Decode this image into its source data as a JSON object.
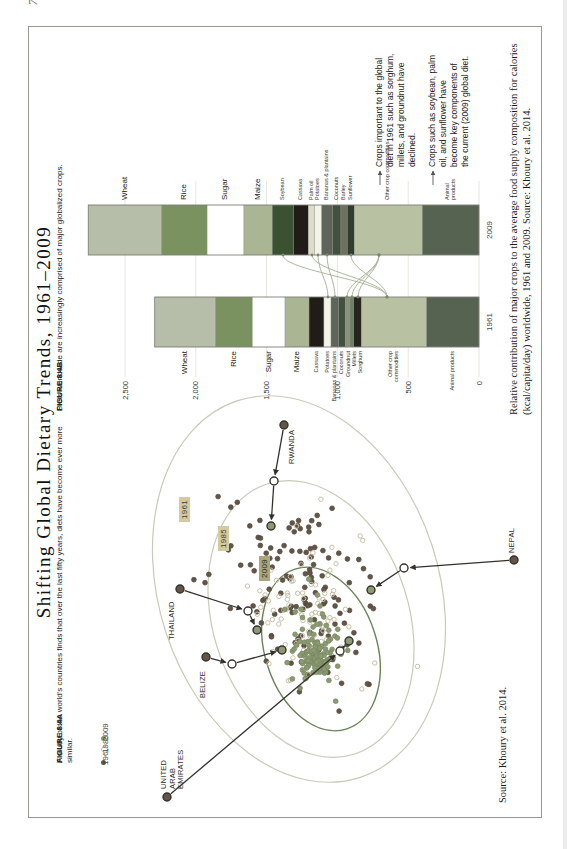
{
  "page": {
    "marker": "74"
  },
  "title": "Shifting Global Dietary Trends, 1961–2009",
  "figureA": {
    "caption_label": "FIGURE 8.4A",
    "caption_text": "A study of the world's countries finds that over the last fifty years, diets have become ever more similar.",
    "source": "Source: Khoury et al. 2014.",
    "legend": [
      {
        "label": "1961",
        "type": "filled",
        "color": "#635648"
      },
      {
        "label": "1985",
        "type": "open",
        "color": "#c7c1a8"
      },
      {
        "label": "2009",
        "type": "filled",
        "color": "#8b9a72"
      }
    ],
    "year_boxes": [
      {
        "label": "1961",
        "x": 295,
        "y": 150,
        "bg": "#d4caa0",
        "fg": "#3f3e35"
      },
      {
        "label": "1985",
        "x": 266,
        "y": 189,
        "bg": "#d4caa0",
        "fg": "#3f3e35"
      },
      {
        "label": "2009",
        "x": 236,
        "y": 230,
        "bg": "#a8a87c",
        "fg": "#262b1c"
      }
    ],
    "ellipses": [
      {
        "cx": 228,
        "cy": 270,
        "rx": 198,
        "ry": 140,
        "rot": -18,
        "stroke": "#c7cbb8",
        "width": 1.2
      },
      {
        "cx": 198,
        "cy": 282,
        "rx": 142,
        "ry": 98,
        "rot": -18,
        "stroke": "#c7cbb8",
        "width": 1.2
      },
      {
        "cx": 168,
        "cy": 292,
        "rx": 84,
        "ry": 56,
        "rot": -18,
        "stroke": "#6a8455",
        "width": 1.4
      }
    ],
    "clusters": [
      {
        "year": "1961",
        "type": "filled",
        "color": "#635648",
        "stroke": "#504538",
        "n": 128,
        "cx": 225,
        "cy": 268,
        "sx": 105,
        "sy": 72,
        "rot": -18,
        "seed": 101
      },
      {
        "year": "1985",
        "type": "open",
        "color": "#ffffff",
        "stroke": "#c7c1a8",
        "n": 92,
        "cx": 200,
        "cy": 280,
        "sx": 75,
        "sy": 52,
        "rot": -18,
        "seed": 202
      },
      {
        "year": "2009",
        "type": "filled",
        "color": "#8b9a72",
        "stroke": "#77865f",
        "n": 68,
        "cx": 175,
        "cy": 290,
        "sx": 42,
        "sy": 30,
        "rot": -18,
        "seed": 303
      },
      {
        "year": "2009",
        "type": "filled",
        "color": "#8b9a72",
        "stroke": "#77865f",
        "n": 72,
        "cx": 160,
        "cy": 288,
        "sx": 17,
        "sy": 12,
        "rot": -18,
        "seed": 404
      }
    ],
    "countries": [
      {
        "name": "UNITED ARAB EMIRATES",
        "label": "UNITED ARAB\nEMIRATES",
        "lx": 28,
        "ly": 131,
        "anchor": "start",
        "points": [
          [
            20,
            138
          ],
          [
            166,
            311
          ],
          [
            176,
            320
          ]
        ]
      },
      {
        "name": "BELIZE",
        "label": "BELIZE",
        "lx": 146,
        "ly": 170,
        "anchor": "end",
        "points": [
          [
            160,
            177
          ],
          [
            153,
            203
          ],
          [
            167,
            253
          ]
        ]
      },
      {
        "name": "THAILAND",
        "label": "THAILAND",
        "lx": 177,
        "ly": 139,
        "anchor": "start",
        "points": [
          [
            228,
            151
          ],
          [
            206,
            219
          ],
          [
            187,
            228
          ]
        ]
      },
      {
        "name": "RWANDA",
        "label": "RWANDA",
        "lx": 353,
        "ly": 259,
        "anchor": "start",
        "points": [
          [
            392,
            255
          ],
          [
            336,
            245
          ],
          [
            291,
            242
          ]
        ]
      },
      {
        "name": "NEPAL",
        "label": "NEPAL",
        "lx": 264,
        "ly": 479,
        "anchor": "start",
        "points": [
          [
            257,
            485
          ],
          [
            249,
            375
          ],
          [
            227,
            342
          ]
        ]
      }
    ]
  },
  "figureB": {
    "caption_label": "FIGURE 8.4B",
    "caption_text": "Diets worldwide are increasingly comprised of major globalized crops.",
    "description": "Relative contribution of major crops to the average food supply composition for calories (kcal/capita/day) worldwide, 1961 and 2009. Source: Khoury et al. 2014.",
    "annotations": [
      {
        "text": "Crops important to the global diet in 1961 such as sorghum, millets, and groundnut have declined."
      },
      {
        "text": "Crops such as soybean, palm oil, and sunflower have become key components of the current (2009) global diet."
      }
    ],
    "connectors": [
      {
        "from": "Sorghum (1961)",
        "to": "Other crop commodities (2009)",
        "y1": 329,
        "y2": 350
      },
      {
        "from": "Millets (1961)",
        "to": "Other crop commodities (2009)",
        "y1": 323,
        "y2": 350
      },
      {
        "from": "Groundnut (1961)",
        "to": "Other crop commodities (2009)",
        "y1": 318,
        "y2": 350
      },
      {
        "from": "Other crop commodities (1961)",
        "to": "Soybean (2009)",
        "y1": 358,
        "y2": 254
      },
      {
        "from": "Other crop commodities (1961)",
        "to": "Palm oil (2009)",
        "y1": 358,
        "y2": 283
      },
      {
        "from": "Other crop commodities (1961)",
        "to": "Sunflower (2009)",
        "y1": 358,
        "y2": 322
      },
      {
        "from": "Potatoes (1961)",
        "to": "Potatoes (2009)",
        "y1": 299,
        "y2": 289
      },
      {
        "from": "Bananas & plantains (1961)",
        "to": "Bananas & plantains (2009)",
        "y1": 306,
        "y2": 298
      }
    ]
  },
  "chart_data": [
    {
      "type": "scatter",
      "title": "FIGURE 8.4A National diet composition map",
      "years": [
        "1961",
        "1985",
        "2009"
      ],
      "note": "Each country has a point for 1961 (dark), 1985 (open) and 2009 (green); ellipses enclose each year's spread and shrink toward the center over time, showing diets becoming more similar. Highlighted countries with arrows: United Arab Emirates, Belize, Thailand, Rwanda, Nepal.",
      "legend_position": "top-left",
      "grid": false
    },
    {
      "type": "bar",
      "stacked": true,
      "title": "FIGURE 8.4B Global food supply composition",
      "xlabel": "",
      "ylabel": "kcal/capita/day",
      "categories": [
        "1961",
        "2009"
      ],
      "ylim": [
        0,
        2500
      ],
      "yticks": [
        {
          "label": "0",
          "value": 0
        },
        {
          "label": "500",
          "value": 500
        },
        {
          "label": "1,000",
          "value": 1000
        },
        {
          "label": "1,500",
          "value": 1500
        },
        {
          "label": "2,000",
          "value": 2000
        },
        {
          "label": "2,500",
          "value": 2500
        }
      ],
      "totals": [
        2290,
        2760
      ],
      "series": [
        {
          "name": "Wheat",
          "values": [
            430,
            520
          ],
          "color": "#b6bda9",
          "big": true
        },
        {
          "name": "Rice",
          "values": [
            260,
            320
          ],
          "color": "#7a9160",
          "big": true
        },
        {
          "name": "Sugar",
          "values": [
            230,
            260
          ],
          "color": "#ffffff",
          "big": true
        },
        {
          "name": "Maize",
          "values": [
            170,
            200
          ],
          "color": "#a9b593",
          "big": true
        },
        {
          "name": "Soybean",
          "values": [
            0,
            150
          ],
          "color": "#3a5232"
        },
        {
          "name": "Cassava",
          "values": [
            105,
            105
          ],
          "color": "#211c17"
        },
        {
          "name": "Palm oil",
          "values": [
            0,
            45
          ],
          "color": "#dcdcc8"
        },
        {
          "name": "Potatoes",
          "values": [
            50,
            50
          ],
          "color": "#f4f3ea"
        },
        {
          "name": "Bananas & plantains",
          "values": [
            55,
            75
          ],
          "color": "#5d645a"
        },
        {
          "name": "Coconuts",
          "values": [
            45,
            60
          ],
          "color": "#42513f"
        },
        {
          "name": "Groundnut",
          "values": [
            30,
            0
          ],
          "color": "#8b907b"
        },
        {
          "name": "Millets",
          "values": [
            30,
            0
          ],
          "color": "#70806a"
        },
        {
          "name": "Sorghum",
          "values": [
            55,
            0
          ],
          "color": "#26261f"
        },
        {
          "name": "Barley",
          "values": [
            0,
            45
          ],
          "color": "#6d7260"
        },
        {
          "name": "Sunflower",
          "values": [
            0,
            50
          ],
          "color": "#303c2c"
        },
        {
          "name": "Other crop commodities",
          "values": [
            460,
            480
          ],
          "color": "#b8c2a3",
          "label_1961": "Other crop\ncommodities",
          "label_2009": "Other crop commodities"
        },
        {
          "name": "Animal products",
          "values": [
            370,
            400
          ],
          "color": "#576351",
          "label_1961": "Animal products",
          "label_2009": "Animal\nproducts"
        }
      ]
    }
  ]
}
